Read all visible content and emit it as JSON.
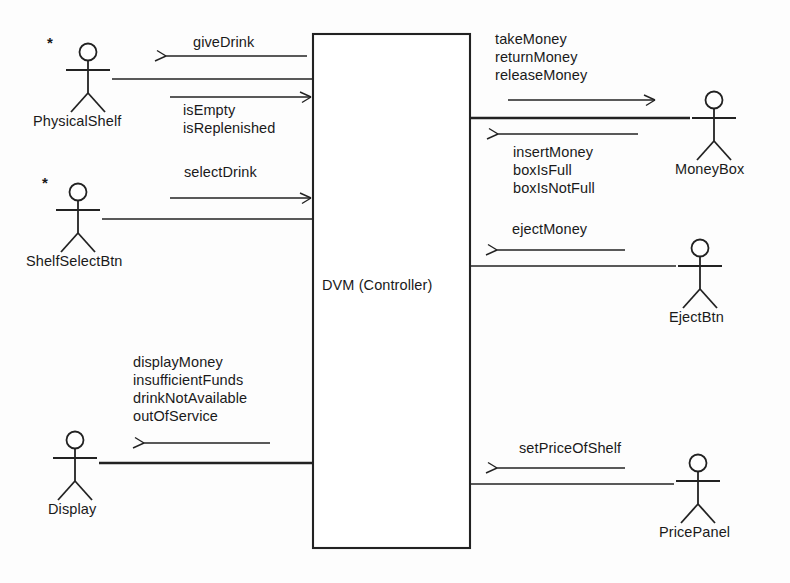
{
  "diagram": {
    "type": "uml-collaboration-context-diagram",
    "line_color": "#222222",
    "text_color": "#1a1a1a",
    "background": "#fdfdfd",
    "system": {
      "label": "DVM (Controller)",
      "x": 313,
      "y": 34,
      "width": 157,
      "height": 514
    },
    "actors": [
      {
        "id": "physical-shelf",
        "name": "PhysicalShelf",
        "multiplicity": "*",
        "side": "left",
        "head_cx": 88,
        "head_cy": 52,
        "label_x": 33,
        "label_y": 113
      },
      {
        "id": "shelf-select-btn",
        "name": "ShelfSelectBtn",
        "multiplicity": "*",
        "side": "left",
        "head_cx": 78,
        "head_cy": 192,
        "label_x": 26,
        "label_y": 253
      },
      {
        "id": "display",
        "name": "Display",
        "multiplicity": "",
        "side": "left",
        "head_cx": 75,
        "head_cy": 440,
        "label_x": 48,
        "label_y": 501
      },
      {
        "id": "money-box",
        "name": "MoneyBox",
        "multiplicity": "",
        "side": "right",
        "head_cx": 714,
        "head_cy": 100,
        "label_x": 675,
        "label_y": 161
      },
      {
        "id": "eject-btn",
        "name": "EjectBtn",
        "multiplicity": "",
        "side": "right",
        "head_cx": 700,
        "head_cy": 248,
        "label_x": 669,
        "label_y": 309
      },
      {
        "id": "price-panel",
        "name": "PricePanel",
        "multiplicity": "",
        "side": "right",
        "head_cx": 698,
        "head_cy": 463,
        "label_x": 659,
        "label_y": 524
      }
    ],
    "messages": [
      {
        "id": "give-drink",
        "lines": [
          "giveDrink"
        ],
        "direction": "system-to-actor",
        "actor": "physical-shelf",
        "label_x": 193,
        "label_y": 33,
        "align": "left"
      },
      {
        "id": "is-empty-is-replenished",
        "lines": [
          "isEmpty",
          "isReplenished"
        ],
        "direction": "actor-to-system",
        "actor": "physical-shelf",
        "label_x": 183,
        "label_y": 101,
        "align": "left"
      },
      {
        "id": "select-drink",
        "lines": [
          "selectDrink"
        ],
        "direction": "actor-to-system",
        "actor": "shelf-select-btn",
        "label_x": 184,
        "label_y": 163,
        "align": "left"
      },
      {
        "id": "display-messages",
        "lines": [
          "displayMoney",
          "insufficientFunds",
          "drinkNotAvailable",
          "outOfService"
        ],
        "direction": "system-to-actor",
        "actor": "display",
        "label_x": 133,
        "label_y": 353,
        "align": "left"
      },
      {
        "id": "take-return-release-money",
        "lines": [
          "takeMoney",
          "returnMoney",
          "releaseMoney"
        ],
        "direction": "system-to-actor",
        "actor": "money-box",
        "label_x": 495,
        "label_y": 30,
        "align": "left"
      },
      {
        "id": "insert-money-box-full",
        "lines": [
          "insertMoney",
          "boxIsFull",
          "boxIsNotFull"
        ],
        "direction": "actor-to-system",
        "actor": "money-box",
        "label_x": 513,
        "label_y": 143,
        "align": "left"
      },
      {
        "id": "eject-money",
        "lines": [
          "ejectMoney"
        ],
        "direction": "actor-to-system",
        "actor": "eject-btn",
        "label_x": 512,
        "label_y": 220,
        "align": "left"
      },
      {
        "id": "set-price-of-shelf",
        "lines": [
          "setPriceOfShelf"
        ],
        "direction": "actor-to-system",
        "actor": "price-panel",
        "label_x": 519,
        "label_y": 439,
        "align": "left"
      }
    ]
  }
}
